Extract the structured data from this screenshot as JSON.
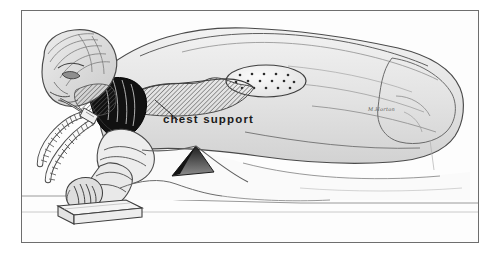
{
  "figure": {
    "kind": "medical-line-illustration",
    "background_color": "#ffffff",
    "frame_color": "#6e6e6e",
    "ink_color": "#333333",
    "shade_color": "#cfcfcf",
    "label": {
      "text": "chest support",
      "leader_line": true
    },
    "signature": {
      "text": "M.Horton"
    },
    "annotations": {
      "hatched_region_name": "chest support roll",
      "dotted_pad_name": "electrosurgical grounding pad",
      "black_band_name": "axillary shoulder strap",
      "tubing_name": "corrugated anesthesia breathing circuit",
      "armboard_name": "padded armboard block",
      "dark_triangle_name": "shadow under flexed hip"
    }
  }
}
